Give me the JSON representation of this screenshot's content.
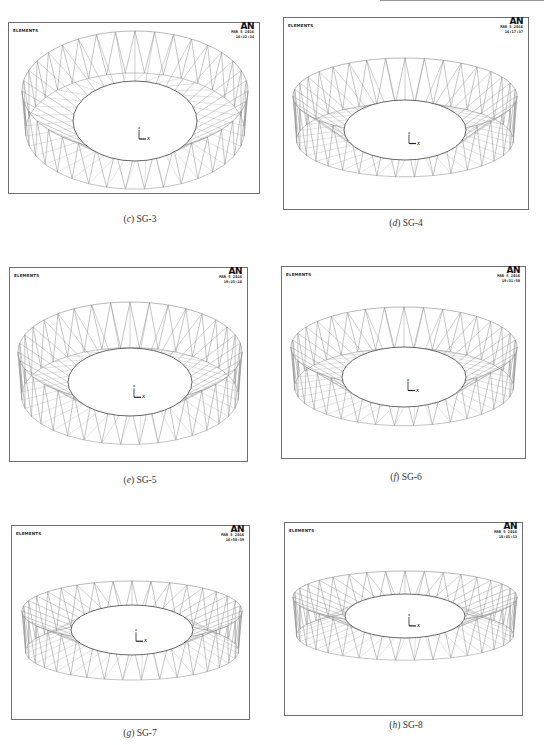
{
  "figures": [
    {
      "id": "c",
      "caption_letter": "c",
      "caption_name": "SG-3",
      "header": {
        "label": "ELEMENTS",
        "logo": "AN",
        "date": "MAR 5 2016",
        "time": "16:22:34"
      }
    },
    {
      "id": "d",
      "caption_letter": "d",
      "caption_name": "SG-4",
      "header": {
        "label": "ELEMENTS",
        "logo": "AN",
        "date": "MAR 5 2016",
        "time": "16:17:37"
      }
    },
    {
      "id": "e",
      "caption_letter": "e",
      "caption_name": "SG-5",
      "header": {
        "label": "ELEMENTS",
        "logo": "AN",
        "date": "MAR 5 2016",
        "time": "19:25:16"
      }
    },
    {
      "id": "f",
      "caption_letter": "f",
      "caption_name": "SG-6",
      "header": {
        "label": "ELEMENTS",
        "logo": "AN",
        "date": "MAR 5 2016",
        "time": "19:31:58"
      }
    },
    {
      "id": "g",
      "caption_letter": "g",
      "caption_name": "SG-7",
      "header": {
        "label": "ELEMENTS",
        "logo": "AN",
        "date": "MAR 5 2016",
        "time": "16:50:39"
      }
    },
    {
      "id": "h",
      "caption_letter": "h",
      "caption_name": "SG-8",
      "header": {
        "label": "ELEMENTS",
        "logo": "AN",
        "date": "MAR 5 2016",
        "time": "16:45:13"
      }
    }
  ],
  "axis_triad": {
    "z": "z",
    "x": "x"
  },
  "colors": {
    "frame": "#6f6f6f",
    "mesh": "#8a8a8a",
    "inner_ring": "#555555",
    "text": "#222222"
  }
}
